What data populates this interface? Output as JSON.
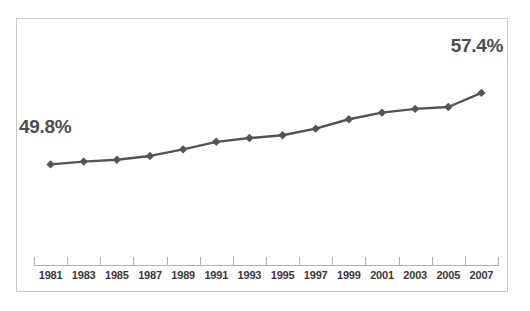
{
  "chart_data": {
    "type": "line",
    "title": "",
    "subtitle": "",
    "xlabel": "",
    "ylabel": "",
    "grid": false,
    "legend": "none",
    "categories": [
      "1981",
      "1983",
      "1985",
      "1987",
      "1989",
      "1991",
      "1993",
      "1995",
      "1997",
      "1999",
      "2001",
      "2003",
      "2005",
      "2007"
    ],
    "x": [
      1981,
      1983,
      1985,
      1987,
      1989,
      1991,
      1993,
      1995,
      1997,
      1999,
      2001,
      2003,
      2005,
      2007
    ],
    "values": [
      49.8,
      50.1,
      50.3,
      50.7,
      51.4,
      52.2,
      52.6,
      52.9,
      53.6,
      54.6,
      55.3,
      55.7,
      55.9,
      57.4
    ],
    "ylim": [
      44.0,
      61.0
    ],
    "xlim": [
      1980,
      2008
    ],
    "unit": "%",
    "annotations": [
      {
        "name": "first-point-label",
        "text": "49.8%",
        "value": 49.8,
        "category": "1981"
      },
      {
        "name": "last-point-label",
        "text": "57.4%",
        "value": 57.4,
        "category": "2007"
      }
    ],
    "series": [
      {
        "name": "",
        "marker": "diamond",
        "line_color": "#545454",
        "marker_color": "#545454",
        "values": [
          49.8,
          50.1,
          50.3,
          50.7,
          51.4,
          52.2,
          52.6,
          52.9,
          53.6,
          54.6,
          55.3,
          55.7,
          55.9,
          57.4
        ]
      }
    ]
  },
  "labels": {
    "start_value": "49.8%",
    "end_value": "57.4%"
  },
  "colors": {
    "series": "#545454",
    "axis": "#b0b0b0",
    "frame": "#c9c9c9",
    "text": "#3a3a3a",
    "label_text": "#4d4d4d",
    "background": "#ffffff"
  }
}
